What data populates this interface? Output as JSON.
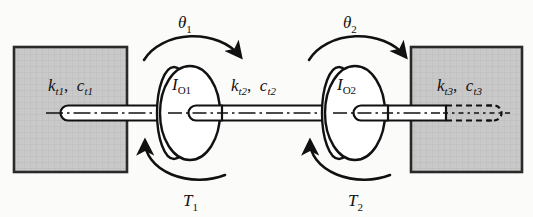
{
  "figure": {
    "name": "torsional-two-disk-system",
    "background_color": "#fbfbfa",
    "stroke_color": "#111111",
    "wall_fill_color": "#c9c9c9",
    "wall_edge_color": "#2a2a2a",
    "shaft_fill_color": "#ffffff"
  },
  "walls": {
    "left": {
      "name": "left-fixed-wall",
      "label_k": "k",
      "label_k_sub": "t1",
      "label_comma": ",",
      "label_c": "c",
      "label_c_sub": "t1",
      "full_label": "k_t1,  c_t1"
    },
    "right": {
      "name": "right-fixed-wall",
      "label_k": "k",
      "label_k_sub": "t3",
      "label_comma": ",",
      "label_c": "c",
      "label_c_sub": "t3",
      "full_label": "k_t3,  c_t3"
    }
  },
  "middle_shaft": {
    "name": "middle-shaft-segment",
    "label_k": "k",
    "label_k_sub": "t2",
    "label_comma": ",",
    "label_c": "c",
    "label_c_sub": "t2",
    "full_label": "k_t2,  c_t2"
  },
  "disks": [
    {
      "name": "disk-1",
      "label_main": "I",
      "label_sub": "O1",
      "full_label": "I_O1",
      "rotation_label": "θ",
      "rotation_sub": "1",
      "rotation_full": "θ_1",
      "rotation_direction": "clockwise",
      "torque_label": "T",
      "torque_sub": "1",
      "torque_full": "T_1",
      "torque_direction": "counterclockwise"
    },
    {
      "name": "disk-2",
      "label_main": "I",
      "label_sub": "O2",
      "full_label": "I_O2",
      "rotation_label": "θ",
      "rotation_sub": "2",
      "rotation_full": "θ_2",
      "rotation_direction": "clockwise",
      "torque_label": "T",
      "torque_sub": "2",
      "torque_full": "T_2",
      "torque_direction": "counterclockwise"
    }
  ]
}
